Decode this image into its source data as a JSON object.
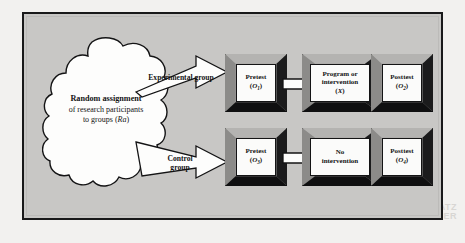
{
  "figure": {
    "type": "flow-diagram",
    "background_color": "#c8c7c5",
    "border_color": "#19191a"
  },
  "source_node": {
    "shape": "cloud",
    "line1": "Random assignment",
    "line2": "of research participants",
    "line3_prefix": "to groups (",
    "line3_symbol": "Ra",
    "line3_suffix": ")"
  },
  "branches": [
    {
      "label_line1": "Experimental group",
      "label_line2": ""
    },
    {
      "label_line1": "Control",
      "label_line2": "group"
    }
  ],
  "rows": [
    {
      "name": "experimental-row",
      "boxes": [
        {
          "label": "Pretest",
          "symbol": "O",
          "subscript": "1",
          "paren": true
        },
        {
          "label_line1": "Program or",
          "label_line2": "intervention",
          "symbol": "X",
          "subscript": "",
          "paren": true
        },
        {
          "label": "Posttest",
          "symbol": "O",
          "subscript": "2",
          "paren": true
        }
      ]
    },
    {
      "name": "control-row",
      "boxes": [
        {
          "label": "Pretest",
          "symbol": "O",
          "subscript": "3",
          "paren": true
        },
        {
          "label_line1": "No",
          "label_line2": "intervention",
          "symbol": "",
          "subscript": "",
          "paren": false
        },
        {
          "label": "Posttest",
          "symbol": "O",
          "subscript": "4",
          "paren": true
        }
      ]
    }
  ],
  "scan_artifact": {
    "line1": "CATZ",
    "line2": "LISHER"
  }
}
